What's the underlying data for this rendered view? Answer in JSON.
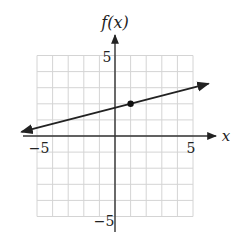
{
  "chart_data": {
    "type": "line",
    "title": "",
    "xlabel": "x",
    "ylabel": "f(x)",
    "xlim": [
      -5,
      5
    ],
    "ylim": [
      -5,
      5
    ],
    "grid": true,
    "x_ticks": [
      {
        "value": -5,
        "label": "−5"
      },
      {
        "value": 5,
        "label": "5"
      }
    ],
    "y_ticks": [
      {
        "value": 5,
        "label": "5"
      },
      {
        "value": -5,
        "label": "−5"
      }
    ],
    "series": [
      {
        "name": "f(x)",
        "equation": "f(x) = x/4 + 7/4",
        "slope": 0.25,
        "intercept": 1.75,
        "x": [
          -6,
          6
        ],
        "values": [
          0.25,
          3.25
        ],
        "arrows_both_ends": true
      }
    ],
    "points": [
      {
        "x": 1,
        "y": 2
      }
    ],
    "legend": null
  },
  "colors": {
    "grid": "#d4d4d4",
    "axis": "#333333",
    "line": "#222222",
    "point": "#111111"
  }
}
